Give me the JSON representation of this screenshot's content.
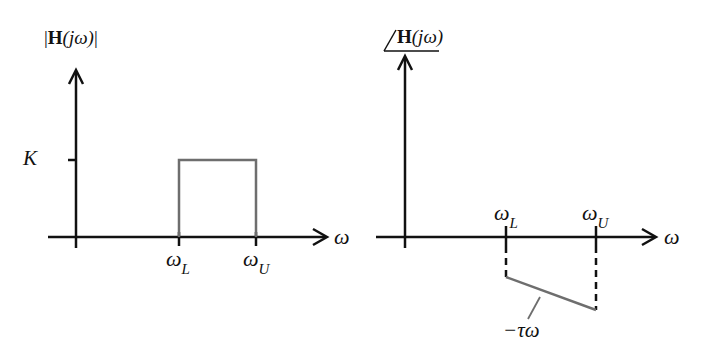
{
  "magnitude_plot": {
    "ylabel_pre": "|",
    "ylabel_H": "H",
    "ylabel_arg": "(jω)",
    "ylabel_post": "|",
    "xlabel": "ω",
    "level_label": "K",
    "tick_lower": {
      "sym": "ω",
      "sub": "L"
    },
    "tick_upper": {
      "sym": "ω",
      "sub": "U"
    }
  },
  "phase_plot": {
    "ylabel_H": "H",
    "ylabel_arg": "(jω)",
    "xlabel": "ω",
    "tick_lower": {
      "sym": "ω",
      "sub": "L"
    },
    "tick_upper": {
      "sym": "ω",
      "sub": "U"
    },
    "slope_label": "−τω"
  },
  "colors": {
    "axis": "#111111",
    "curve": "#6e6e6e"
  }
}
